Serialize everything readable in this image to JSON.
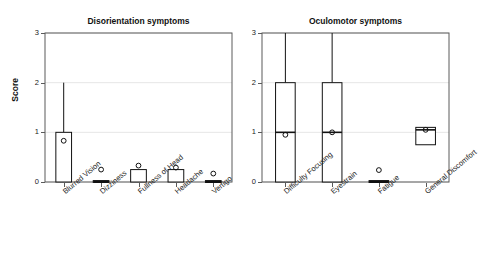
{
  "figure": {
    "background": "#ffffff",
    "ink": "#111111",
    "grid_color": "#e6e6e6",
    "frame_color": "#5a5a5a"
  },
  "axes": {
    "ylabel": "Score",
    "yticks": [
      "0",
      "1",
      "2",
      "3"
    ],
    "ylim": [
      0,
      3
    ]
  },
  "chart_data": {
    "type": "box",
    "title": "",
    "xlabel": "",
    "ylabel": "Score",
    "ylim": [
      0,
      3
    ],
    "yticks": [
      0,
      1,
      2,
      3
    ],
    "grid": "horizontal",
    "legend": "none",
    "marker": "mean-circle",
    "panels": [
      {
        "title": "Disorientation symptoms",
        "categories": [
          "Blurred Vision",
          "Dizziness",
          "Fullness of Head",
          "Headache",
          "Vertigo"
        ],
        "boxes": [
          {
            "label": "Blurred Vision",
            "whisker_low": 0,
            "q1": 0,
            "median": 0,
            "q3": 1,
            "whisker_high": 2,
            "mean": 0.83
          },
          {
            "label": "Dizziness",
            "whisker_low": 0,
            "q1": 0,
            "median": 0,
            "q3": 0,
            "whisker_high": 0,
            "mean": 0.25
          },
          {
            "label": "Fullness of Head",
            "whisker_low": 0,
            "q1": 0,
            "median": 0,
            "q3": 0.25,
            "whisker_high": 0.25,
            "mean": 0.33
          },
          {
            "label": "Headache",
            "whisker_low": 0,
            "q1": 0,
            "median": 0,
            "q3": 0.25,
            "whisker_high": 0.25,
            "mean": 0.29
          },
          {
            "label": "Vertigo",
            "whisker_low": 0,
            "q1": 0,
            "median": 0,
            "q3": 0,
            "whisker_high": 0,
            "mean": 0.17
          }
        ]
      },
      {
        "title": "Oculomotor symptoms",
        "categories": [
          "Difficulty Focusing",
          "Eyestrain",
          "Fatigue",
          "General Discomfort"
        ],
        "boxes": [
          {
            "label": "Difficulty Focusing",
            "whisker_low": 0,
            "q1": 0,
            "median": 1,
            "q3": 2,
            "whisker_high": 3,
            "mean": 0.95
          },
          {
            "label": "Eyestrain",
            "whisker_low": 0,
            "q1": 0,
            "median": 1,
            "q3": 2,
            "whisker_high": 3,
            "mean": 1.0
          },
          {
            "label": "Fatigue",
            "whisker_low": 0,
            "q1": 0,
            "median": 0,
            "q3": 0,
            "whisker_high": 0,
            "mean": 0.24
          },
          {
            "label": "General Discomfort",
            "whisker_low": 0.75,
            "q1": 0.75,
            "median": 1.05,
            "q3": 1.1,
            "whisker_high": 1.1,
            "mean": 1.05
          }
        ]
      }
    ]
  }
}
